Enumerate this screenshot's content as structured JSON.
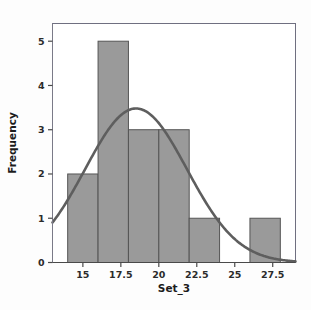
{
  "chart_data": {
    "type": "bar",
    "title": "",
    "subtitle": "",
    "xlabel": "Set_3",
    "ylabel": "Frequency",
    "xlim": [
      13,
      29
    ],
    "ylim": [
      0,
      5.4
    ],
    "grid": false,
    "legend": null,
    "bin_width": 2,
    "bin_edges": [
      14,
      16,
      18,
      20,
      22,
      24,
      26,
      28
    ],
    "categories": [
      "14-16",
      "16-18",
      "18-20",
      "20-22",
      "22-24",
      "24-26",
      "26-28"
    ],
    "values": [
      2,
      5,
      3,
      3,
      1,
      0,
      1
    ],
    "bar_color": "#9a9a9a",
    "bar_edge_color": "#555555",
    "xticks": [
      15,
      17.5,
      20,
      22.5,
      25,
      27.5
    ],
    "xtick_labels": [
      "15",
      "17.5",
      "20",
      "22.5",
      "25",
      "27.5"
    ],
    "yticks": [
      0,
      1,
      2,
      3,
      4,
      5
    ],
    "ytick_labels": [
      "0",
      "1",
      "2",
      "3",
      "4",
      "5"
    ],
    "overlay": {
      "type": "line",
      "name": "normal-fit-curve",
      "color": "#5e5e5e",
      "mean": 18.5,
      "stdev": 3.35,
      "peak_y": 3.48,
      "start_y": 1.15,
      "end_y": 0.04
    },
    "plot_bg": "#ffffff",
    "frame_color": "#6f6f80"
  },
  "axes": {
    "x_title": "Set_3",
    "y_title": "Frequency"
  }
}
